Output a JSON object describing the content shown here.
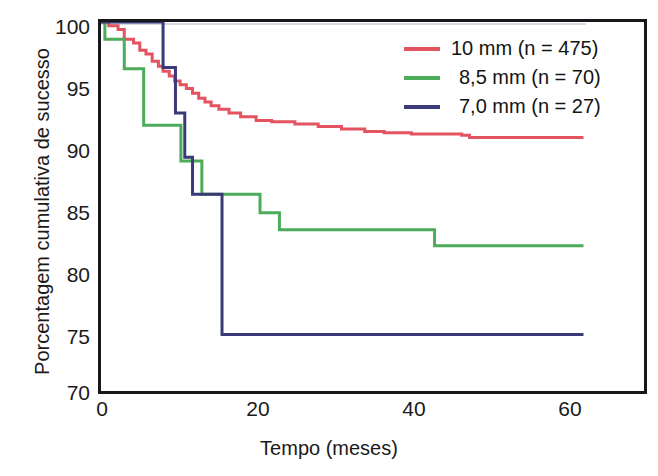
{
  "chart_data": {
    "type": "line",
    "title": "",
    "xlabel": "Tempo (meses)",
    "ylabel": "Porcentagem cumulativa de sucesso",
    "xlim": [
      0,
      70
    ],
    "ylim": [
      70,
      100
    ],
    "xticks": [
      0,
      20,
      40,
      60
    ],
    "yticks": [
      70,
      75,
      80,
      85,
      90,
      95,
      100
    ],
    "grid": false,
    "legend_position": "top-right",
    "series": [
      {
        "name": "10 mm  (n = 475)",
        "label": "10 mm",
        "n": 475,
        "color": "#e35360",
        "step": "post",
        "points": [
          [
            0,
            100.0
          ],
          [
            1.0,
            99.7
          ],
          [
            2.2,
            99.4
          ],
          [
            3.0,
            98.6
          ],
          [
            4.2,
            98.3
          ],
          [
            5.0,
            97.7
          ],
          [
            5.8,
            97.4
          ],
          [
            6.6,
            96.8
          ],
          [
            7.4,
            96.4
          ],
          [
            8.0,
            96.0
          ],
          [
            8.8,
            95.6
          ],
          [
            9.5,
            95.2
          ],
          [
            10.2,
            94.9
          ],
          [
            11.0,
            94.6
          ],
          [
            11.8,
            94.2
          ],
          [
            12.6,
            93.8
          ],
          [
            13.4,
            93.5
          ],
          [
            14.2,
            93.2
          ],
          [
            15.2,
            92.9
          ],
          [
            16.5,
            92.6
          ],
          [
            18.0,
            92.3
          ],
          [
            20.0,
            92.0
          ],
          [
            22.0,
            91.9
          ],
          [
            25.0,
            91.7
          ],
          [
            28.0,
            91.5
          ],
          [
            31.0,
            91.3
          ],
          [
            34.0,
            91.1
          ],
          [
            36.5,
            91.0
          ],
          [
            40.0,
            90.9
          ],
          [
            46.5,
            90.8
          ],
          [
            47.5,
            90.6
          ],
          [
            62.2,
            90.6
          ]
        ]
      },
      {
        "name": "8,5 mm (n = 70)",
        "label": "8,5 mm",
        "n": 70,
        "color": "#4cac59",
        "step": "post",
        "points": [
          [
            0,
            100.0
          ],
          [
            0.5,
            98.6
          ],
          [
            3.0,
            96.2
          ],
          [
            5.5,
            91.6
          ],
          [
            10.3,
            88.7
          ],
          [
            13.0,
            86.0
          ],
          [
            19.5,
            86.0
          ],
          [
            20.5,
            84.5
          ],
          [
            23.0,
            83.1
          ],
          [
            42.0,
            83.1
          ],
          [
            43.0,
            81.8
          ],
          [
            62.2,
            81.8
          ]
        ]
      },
      {
        "name": "7,0 mm (n = 27)",
        "label": "7,0 mm",
        "n": 27,
        "color": "#3a3a78",
        "step": "post",
        "points": [
          [
            0,
            100.0
          ],
          [
            7.7,
            100.0
          ],
          [
            8.0,
            96.3
          ],
          [
            9.3,
            96.3
          ],
          [
            9.6,
            92.6
          ],
          [
            10.5,
            92.6
          ],
          [
            10.8,
            89.0
          ],
          [
            11.5,
            89.0
          ],
          [
            11.8,
            86.0
          ],
          [
            15.3,
            86.0
          ],
          [
            15.6,
            74.6
          ],
          [
            62.2,
            74.6
          ]
        ]
      }
    ]
  },
  "legend": {
    "items": [
      {
        "label": "10 mm  (n = 475)",
        "color": "#e35360"
      },
      {
        "label": "8,5 mm (n = 70)",
        "color": "#4cac59"
      },
      {
        "label": "7,0 mm (n = 27)",
        "color": "#3a3a78"
      }
    ]
  },
  "axes": {
    "y_title": "Porcentagem cumulativa de sucesso",
    "x_title": "Tempo (meses)",
    "y_tick_labels": [
      "100",
      "95",
      "90",
      "85",
      "80",
      "75",
      "70"
    ],
    "x_tick_labels": [
      "0",
      "20",
      "40",
      "60"
    ]
  }
}
